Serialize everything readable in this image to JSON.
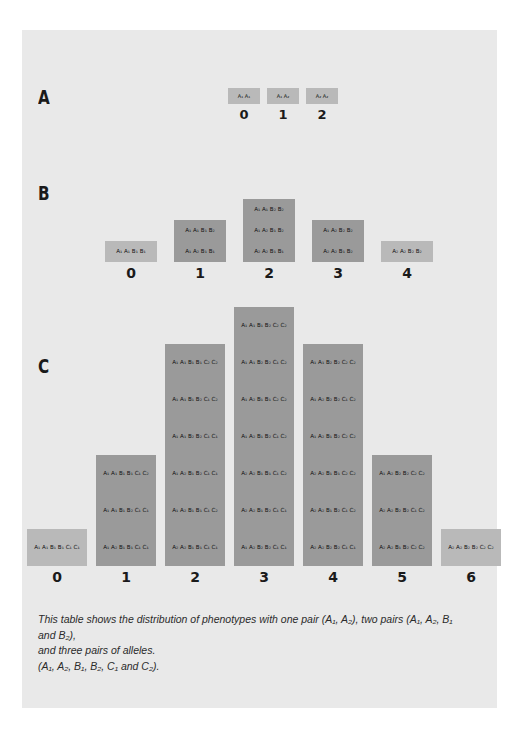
{
  "figure": {
    "panels": [
      {
        "letter": "A",
        "axis_ticks": [
          "0",
          "1",
          "2"
        ],
        "columns": [
          {
            "tick": "0",
            "cells": [
              "A₁ A₁"
            ]
          },
          {
            "tick": "1",
            "cells": [
              "A₁ A₂"
            ]
          },
          {
            "tick": "2",
            "cells": [
              "A₂ A₂"
            ]
          }
        ]
      },
      {
        "letter": "B",
        "axis_ticks": [
          "0",
          "1",
          "2",
          "3",
          "4"
        ],
        "columns": [
          {
            "tick": "0",
            "cells": [
              "A₁ A₁ B₁ B₁"
            ]
          },
          {
            "tick": "1",
            "cells": [
              "A₁ A₂ B₁ B₁",
              "A₁ A₁ B₁ B₂"
            ]
          },
          {
            "tick": "2",
            "cells": [
              "A₂ A₂ B₁ B₁",
              "A₁ A₂ B₁ B₂",
              "A₁ A₁ B₂ B₂"
            ]
          },
          {
            "tick": "3",
            "cells": [
              "A₂ A₂ B₁ B₂",
              "A₁ A₂ B₂ B₂"
            ]
          },
          {
            "tick": "4",
            "cells": [
              "A₂ A₂ B₂ B₂"
            ]
          }
        ]
      },
      {
        "letter": "C",
        "axis_ticks": [
          "0",
          "1",
          "2",
          "3",
          "4",
          "5",
          "6"
        ],
        "columns": [
          {
            "tick": "0",
            "cells": [
              "A₁ A₁ B₁ B₁ C₁ C₁"
            ]
          },
          {
            "tick": "1",
            "cells": [
              "A₁ A₂ B₁ B₁ C₁ C₁",
              "A₁ A₁ B₁ B₂ C₁ C₁",
              "A₁ A₁ B₁ B₁ C₁ C₂"
            ]
          },
          {
            "tick": "2",
            "cells": [
              "A₂ A₂ B₁ B₁ C₁ C₁",
              "A₁ A₂ B₁ B₁ C₁ C₂",
              "A₁ A₂ B₁ B₂ C₁ C₁",
              "A₁ A₁ B₂ B₂ C₁ C₁",
              "A₁ A₁ B₁ B₂ C₁ C₂",
              "A₁ A₁ B₁ B₁ C₂ C₂"
            ]
          },
          {
            "tick": "3",
            "cells": [
              "A₁ A₂ B₂ B₂ C₁ C₁",
              "A₂ A₂ B₁ B₂ C₁ C₁",
              "A₂ A₂ B₁ B₁ C₁ C₂",
              "A₁ A₂ B₁ B₂ C₁ C₂",
              "A₁ A₂ B₁ B₁ C₂ C₂",
              "A₁ A₁ B₂ B₂ C₁ C₂",
              "A₁ A₁ B₁ B₂ C₂ C₂"
            ]
          },
          {
            "tick": "4",
            "cells": [
              "A₂ A₂ B₂ B₂ C₁ C₁",
              "A₂ A₂ B₁ B₂ C₁ C₂",
              "A₂ A₂ B₁ B₁ C₂ C₂",
              "A₁ A₂ B₁ B₂ C₂ C₂",
              "A₁ A₂ B₂ B₂ C₁ C₂",
              "A₁ A₁ B₂ B₂ C₂ C₂"
            ]
          },
          {
            "tick": "5",
            "cells": [
              "A₂ A₂ B₁ B₂ C₂ C₂",
              "A₂ A₂ B₂ B₂ C₁ C₂",
              "A₁ A₂ B₂ B₂ C₂ C₂"
            ]
          },
          {
            "tick": "6",
            "cells": [
              "A₂ A₂ B₂ B₂ C₂ C₂"
            ]
          }
        ]
      }
    ],
    "caption": {
      "line1": "This table shows the distribution of phenotypes with one pair (A₁, A₂), two pairs (A₁, A₂, B₁ and B₂),",
      "line2": "and three pairs of alleles.",
      "line3": "(A₁, A₂, B₁, B₂, C₁ and C₂)."
    }
  },
  "chart_data": {
    "type": "bar",
    "xlabel": "Number of contributing (uppercase-subscript-2) alleles",
    "ylabel": "Number of genotypes",
    "grid": false,
    "legend": "none",
    "panels": [
      {
        "label": "A",
        "categories": [
          "0",
          "1",
          "2"
        ],
        "values": [
          1,
          1,
          1
        ],
        "ylim": [
          0,
          1
        ]
      },
      {
        "label": "B",
        "categories": [
          "0",
          "1",
          "2",
          "3",
          "4"
        ],
        "values": [
          1,
          2,
          3,
          2,
          1
        ],
        "ylim": [
          0,
          3
        ]
      },
      {
        "label": "C",
        "categories": [
          "0",
          "1",
          "2",
          "3",
          "4",
          "5",
          "6"
        ],
        "values": [
          1,
          3,
          6,
          7,
          6,
          3,
          1
        ],
        "ylim": [
          0,
          7
        ]
      }
    ],
    "colors": {
      "bar_dark": "#9a9a9a",
      "bar_light": "#b9b9b9",
      "card_background": "#e9e9e9",
      "page_background": "#ffffff",
      "text": "#111111"
    }
  }
}
